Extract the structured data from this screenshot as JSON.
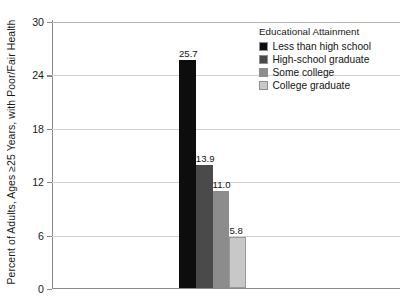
{
  "chart_data": {
    "type": "bar",
    "title": "",
    "xlabel": "",
    "ylabel": "Percent of Adults, Ages ≥25 Years, with Poor/Fair Health",
    "categories": [
      "Less than high school",
      "High-school graduate",
      "Some college",
      "College graduate"
    ],
    "values": [
      25.7,
      13.9,
      11.0,
      5.8
    ],
    "value_labels": [
      "25.7",
      "13.9",
      "11.0",
      "5.8"
    ],
    "colors": [
      "#0d0d0d",
      "#4a4a4a",
      "#8c8c8c",
      "#c8c8c8"
    ],
    "ylim": [
      0,
      30
    ],
    "yticks": [
      0,
      6,
      12,
      18,
      24,
      30
    ],
    "ytick_labels": [
      "0",
      "6",
      "12",
      "18",
      "24",
      "30"
    ],
    "grid": true,
    "grid_axis": "y",
    "legend_position": "top-right",
    "legend_title": "Educational Attainment",
    "legend": [
      {
        "label": "Less than high school",
        "color": "#0d0d0d"
      },
      {
        "label": "High-school graduate",
        "color": "#4a4a4a"
      },
      {
        "label": "Some college",
        "color": "#8c8c8c"
      },
      {
        "label": "College graduate",
        "color": "#c8c8c8"
      }
    ]
  }
}
